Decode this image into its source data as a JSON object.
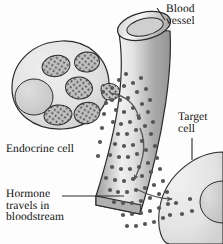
{
  "figure": {
    "width": 223,
    "height": 244,
    "background_color": "#fdfdfd"
  },
  "labels": {
    "blood_vessel": "Blood\nvessel",
    "target_cell": "Target\ncell",
    "endocrine_cell": "Endocrine cell",
    "hormone": "Hormone\ntravels in\nbloodstream"
  },
  "colors": {
    "outline": "#2b2b2b",
    "text": "#111111",
    "cell_fill_light": "#e9e9e9",
    "cell_fill_mid": "#d8d8d8",
    "nucleus_fill": "#cfcfcf",
    "vesicle_fill": "#b8b8b8",
    "granule": "#4d4d4d",
    "hormone_dot": "#555555",
    "vessel_dark": "#8f8f8f",
    "vessel_light": "#f2f2f2",
    "arrow": "#555555"
  },
  "elements": {
    "endocrine_cell": {
      "name": "endocrine-cell",
      "nucleus_count": 1,
      "vesicle_count": 5,
      "budding_vesicle_count": 1
    },
    "blood_vessel": {
      "name": "blood-vessel",
      "has_open_lumen": true,
      "orientation": "diagonal-top-right-to-bottom-left"
    },
    "target_cell": {
      "name": "target-cell",
      "nucleus_count": 1,
      "internal_dot_count": 4
    },
    "hormone_dots": {
      "name": "hormone-dot",
      "count": 78
    },
    "arrows": [
      {
        "name": "arrow-secretion-into-vessel"
      },
      {
        "name": "arrow-transport-in-vessel"
      },
      {
        "name": "arrow-uptake-into-target-cell"
      }
    ],
    "leader_lines": [
      {
        "name": "leader-line-blood-vessel"
      },
      {
        "name": "leader-line-target-cell"
      },
      {
        "name": "leader-line-hormone"
      }
    ]
  }
}
